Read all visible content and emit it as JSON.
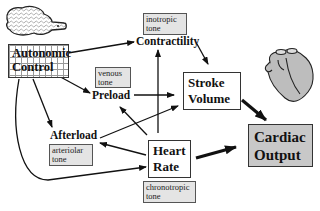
{
  "nodes": {
    "autonomic_control": {
      "line1": "Autonomic",
      "line2": "Control"
    },
    "contractility": "Contractility",
    "preload": "Preload",
    "afterload": "Afterload",
    "stroke_volume": {
      "line1": "Stroke",
      "line2": "Volume"
    },
    "heart_rate": {
      "line1": "Heart",
      "line2": "Rate"
    },
    "cardiac_output": {
      "line1": "Cardiac",
      "line2": "Output"
    }
  },
  "tones": {
    "inotropic": {
      "line1": "inotropic",
      "line2": "tone"
    },
    "venous": {
      "line1": "venous",
      "line2": "tone"
    },
    "arteriolar": {
      "line1": "arteriolar",
      "line2": "tone"
    },
    "chronotropic": {
      "line1": "chronotropic",
      "line2": "tone"
    }
  },
  "icons": [
    "brain-icon",
    "heart-icon"
  ],
  "colors": {
    "cardiac_output_fill": "#c8c8c8",
    "tone_fill": "#e4e4e4",
    "line": "#111111"
  }
}
